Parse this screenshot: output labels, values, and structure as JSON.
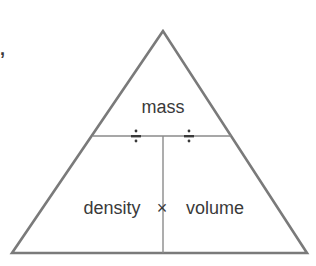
{
  "diagram": {
    "top_label": "mass",
    "bottom_left_label": "density",
    "bottom_right_label": "volume",
    "divide_symbol_left": "÷",
    "divide_symbol_right": "÷",
    "multiply_symbol": "×",
    "stray_mark": ","
  },
  "colors": {
    "outline": "#7a7a7a",
    "inner_lines": "#8a8a8a",
    "text": "#3a3a3a",
    "background": "#ffffff"
  }
}
